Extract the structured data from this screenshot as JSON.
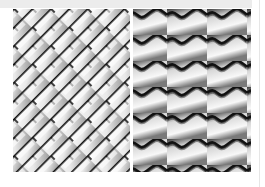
{
  "image": {
    "description": "Two side-by-side grayscale texture swatches",
    "panels": [
      {
        "name": "diagonal-brick-texture",
        "pattern": "diagonal staggered brick / chain-link",
        "tone": "grayscale"
      },
      {
        "name": "wavy-tile-texture",
        "pattern": "horizontal sinusoidal roof-tile waves",
        "rows": 6,
        "tone": "grayscale"
      }
    ],
    "colors": {
      "background": "#ffffff",
      "top_band": "#ececec",
      "line_dark": "#111111",
      "shade_mid": "#9a9a9a",
      "highlight": "#f7f7f7"
    }
  }
}
